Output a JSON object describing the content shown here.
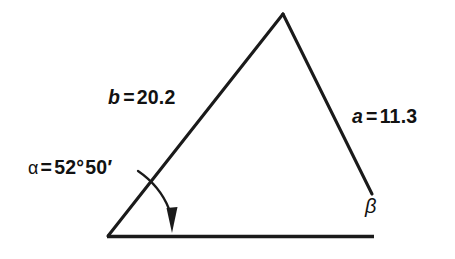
{
  "figure": {
    "kind": "triangle-diagram",
    "background_color": "#ffffff",
    "stroke_color": "#1a1a1a",
    "labels": {
      "side_b": {
        "variable": "b",
        "equals": "=",
        "value": "20.2",
        "full": "b = 20.2"
      },
      "side_a": {
        "variable": "a",
        "equals": "=",
        "value": "11.3",
        "full": "a = 11.3"
      },
      "angle_alpha": {
        "symbol": "α",
        "equals": "=",
        "degrees": "52°",
        "minutes": "50′",
        "full": "α = 52°50′"
      },
      "angle_beta": {
        "symbol": "β"
      }
    },
    "geometry": {
      "vertex_apex": [
        283,
        14
      ],
      "vertex_left": [
        108,
        236
      ],
      "side_a_endpoint": [
        372,
        194
      ],
      "baseline_end": [
        374,
        236
      ],
      "angle_arc_arrow_tip": [
        172,
        233
      ],
      "leader_start": [
        138,
        171
      ]
    }
  }
}
